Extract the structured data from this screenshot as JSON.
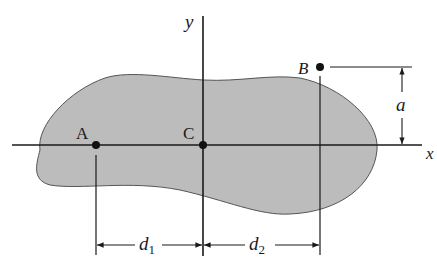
{
  "diagram": {
    "colors": {
      "area_fill": "#bcbcbc",
      "area_stroke": "#555555",
      "line": "#1a1a1a"
    },
    "axes": {
      "x_label": "x",
      "y_label": "y"
    },
    "points": {
      "A": "A",
      "B": "B",
      "C": "C"
    },
    "dimensions": {
      "d1": "d",
      "d1_sub": "1",
      "d2": "d",
      "d2_sub": "2",
      "a": "a"
    }
  }
}
